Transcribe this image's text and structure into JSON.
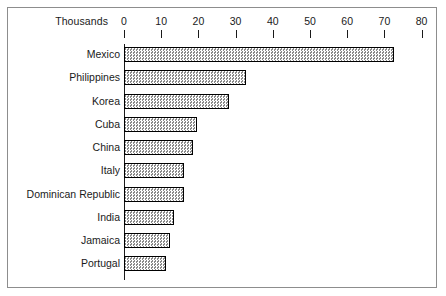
{
  "chart_data": {
    "type": "bar",
    "orientation": "horizontal",
    "title": "",
    "xlabel": "Thousands",
    "ylabel": "",
    "axis_unit_label": "Thousands",
    "categories": [
      "Mexico",
      "Philippines",
      "Korea",
      "Cuba",
      "China",
      "Italy",
      "Dominican Republic",
      "India",
      "Jamaica",
      "Portugal"
    ],
    "values": [
      72.5,
      32.8,
      28.2,
      19.6,
      18.5,
      16.1,
      16.1,
      13.5,
      12.4,
      11.3
    ],
    "xlim": [
      0,
      80
    ],
    "xticks": [
      0,
      10,
      20,
      30,
      40,
      50,
      60,
      70,
      80
    ],
    "xtick_labels": [
      "0",
      "10",
      "20",
      "30",
      "40",
      "50",
      "60",
      "70",
      "80"
    ],
    "grid": false,
    "legend": null,
    "bar_fill": "#d2d2d2",
    "bar_border": "#000000",
    "frame_border": "#8d8d8d",
    "background": "#ffffff"
  }
}
